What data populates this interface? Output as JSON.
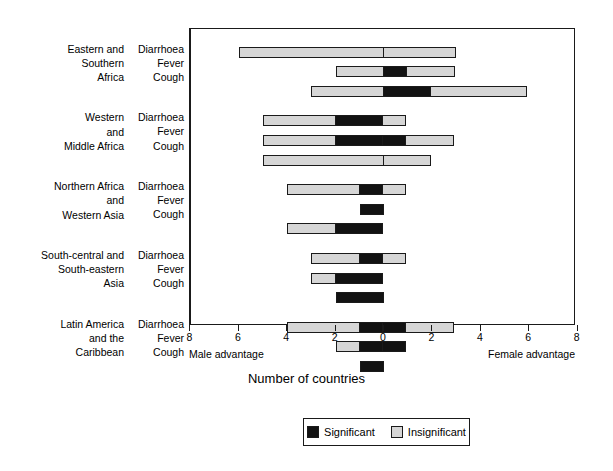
{
  "chart_data": {
    "type": "bar",
    "title": "",
    "xlabel": "Number of countries",
    "ylabel": "",
    "xlim": [
      -8,
      8
    ],
    "grid": false,
    "orientation": "horizontal",
    "stacked": true,
    "legend_position": "bottom",
    "axis_left_note": "Male advantage",
    "axis_right_note": "Female advantage",
    "tick_labels": [
      "8",
      "6",
      "4",
      "2",
      "0",
      "2",
      "4",
      "6",
      "8"
    ],
    "tick_values": [
      -8,
      -6,
      -4,
      -2,
      0,
      2,
      4,
      6,
      8
    ],
    "legend": [
      {
        "label": "Significant",
        "color": "#121212"
      },
      {
        "label": "Insignificant",
        "color": "#d6d6d6"
      }
    ],
    "groups": [
      {
        "region": "Eastern and\nSouthern\nAfrica",
        "rows": [
          {
            "condition": "Diarrhoea",
            "male_insignificant": 6,
            "male_significant": 0,
            "female_significant": 0,
            "female_insignificant": 3
          },
          {
            "condition": "Fever",
            "male_insignificant": 2,
            "male_significant": 0,
            "female_significant": 1,
            "female_insignificant": 2
          },
          {
            "condition": "Cough",
            "male_insignificant": 3,
            "male_significant": 0,
            "female_significant": 2,
            "female_insignificant": 4
          }
        ]
      },
      {
        "region": "Western\nand\nMiddle Africa",
        "rows": [
          {
            "condition": "Diarrhoea",
            "male_insignificant": 3,
            "male_significant": 2,
            "female_significant": 0,
            "female_insignificant": 1
          },
          {
            "condition": "Fever",
            "male_insignificant": 3,
            "male_significant": 2,
            "female_significant": 1,
            "female_insignificant": 2
          },
          {
            "condition": "Cough",
            "male_insignificant": 5,
            "male_significant": 0,
            "female_significant": 0,
            "female_insignificant": 2
          }
        ]
      },
      {
        "region": "Northern Africa\nand\nWestern Asia",
        "rows": [
          {
            "condition": "Diarrhoea",
            "male_insignificant": 3,
            "male_significant": 1,
            "female_significant": 0,
            "female_insignificant": 1
          },
          {
            "condition": "Fever",
            "male_insignificant": 0,
            "male_significant": 1,
            "female_significant": 0,
            "female_insignificant": 0
          },
          {
            "condition": "Cough",
            "male_insignificant": 2,
            "male_significant": 2,
            "female_significant": 0,
            "female_insignificant": 0
          }
        ]
      },
      {
        "region": "South-central and\nSouth-eastern\nAsia",
        "rows": [
          {
            "condition": "Diarrhoea",
            "male_insignificant": 2,
            "male_significant": 1,
            "female_significant": 0,
            "female_insignificant": 1
          },
          {
            "condition": "Fever",
            "male_insignificant": 1,
            "male_significant": 2,
            "female_significant": 0,
            "female_insignificant": 0
          },
          {
            "condition": "Cough",
            "male_insignificant": 0,
            "male_significant": 2,
            "female_significant": 0,
            "female_insignificant": 0
          }
        ]
      },
      {
        "region": "Latin America\nand the\nCaribbean",
        "rows": [
          {
            "condition": "Diarrhoea",
            "male_insignificant": 3,
            "male_significant": 1,
            "female_significant": 1,
            "female_insignificant": 2
          },
          {
            "condition": "Fever",
            "male_insignificant": 1,
            "male_significant": 1,
            "female_significant": 1,
            "female_insignificant": 0
          },
          {
            "condition": "Cough",
            "male_insignificant": 0,
            "male_significant": 1,
            "female_significant": 0,
            "female_insignificant": 0
          }
        ]
      }
    ]
  },
  "layout": {
    "plot_left": 189,
    "plot_top": 28,
    "plot_width": 386,
    "plot_height": 297,
    "zero_x": 383,
    "px_per_unit": 24.2,
    "bar_height": 11,
    "row_step": 19.6,
    "group_gap": 10.0,
    "first_row_center": 51
  }
}
